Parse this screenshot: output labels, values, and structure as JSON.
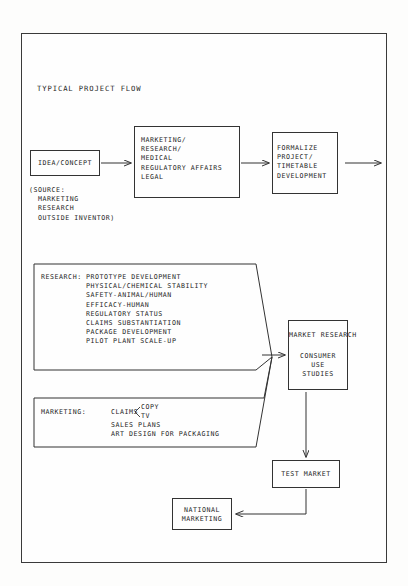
{
  "diagram": {
    "title": "TYPICAL PROJECT FLOW",
    "nodes": {
      "idea": {
        "label": "IDEA/CONCEPT",
        "source_note": "(SOURCE:\n  MARKETING\n  RESEARCH\n  OUTSIDE INVENTOR)"
      },
      "review": {
        "label": "MARKETING/\nRESEARCH/\nMEDICAL\nREGULATORY AFFAIRS\nLEGAL"
      },
      "formalize": {
        "label": "FORMALIZE\nPROJECT/\nTIMETABLE\nDEVELOPMENT"
      },
      "research_panel": {
        "heading": "RESEARCH:",
        "items": "PROTOTYPE DEVELOPMENT\nPHYSICAL/CHEMICAL STABILITY\nSAFETY-ANIMAL/HUMAN\nEFFICACY-HUMAN\nREGULATORY STATUS\nCLAIMS SUBSTANTIATION\nPACKAGE DEVELOPMENT\nPILOT PLANT SCALE-UP"
      },
      "marketing_panel": {
        "heading": "MARKETING:",
        "claims": "CLAIMS",
        "claims_branch_top": "COPY",
        "claims_branch_bottom": "TV",
        "items": "SALES PLANS\nART DESIGN FOR PACKAGING"
      },
      "market_research": {
        "title": "MARKET RESEARCH",
        "body": "CONSUMER\nUSE\nSTUDIES"
      },
      "test_market": {
        "label": "TEST MARKET"
      },
      "national_marketing": {
        "label": "NATIONAL\nMARKETING"
      }
    },
    "colors": {
      "ink": "#242424",
      "line": "#333333",
      "paper": "#fefefe"
    }
  }
}
